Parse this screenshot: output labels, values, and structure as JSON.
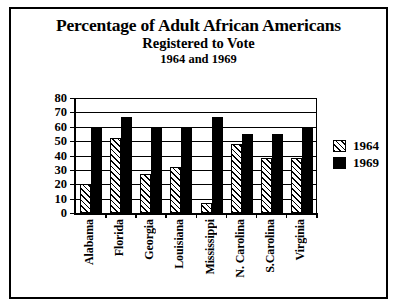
{
  "chart_data": {
    "type": "bar",
    "title": "Percentage of Adult African Americans",
    "subtitle": "Registered to Vote",
    "subtitle2": "1964 and 1969",
    "xlabel": "",
    "ylabel": "",
    "ylim": [
      0,
      80
    ],
    "yticks": [
      0,
      10,
      20,
      30,
      40,
      50,
      60,
      70,
      80
    ],
    "grid": true,
    "legend_position": "right",
    "categories": [
      "Alabama",
      "Florida",
      "Georgia",
      "Louisiana",
      "Mississippi",
      "N. Carolina",
      "S.Carolina",
      "Virginia"
    ],
    "series": [
      {
        "name": "1964",
        "fill": "hatched",
        "values": [
          20,
          52,
          27,
          32,
          7,
          48,
          38,
          38
        ]
      },
      {
        "name": "1969",
        "fill": "solid-black",
        "values": [
          60,
          67,
          60,
          60,
          67,
          55,
          55,
          60
        ]
      }
    ]
  },
  "legend": {
    "items": [
      {
        "label": "1964",
        "swatch": "hatched-swatch"
      },
      {
        "label": "1969",
        "swatch": "black-swatch"
      }
    ]
  },
  "colors": {
    "ink": "#000000",
    "paper": "#ffffff"
  }
}
